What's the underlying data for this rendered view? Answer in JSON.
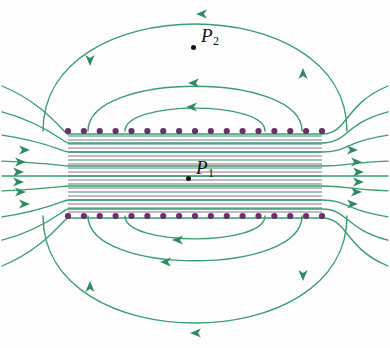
{
  "figure": {
    "kind": "electric-field-line-diagram",
    "background_color": "#fdfdfd",
    "line_color": "#3a9e6e",
    "line_color_dark": "#2f8a61",
    "charge_color": "#6b2f6b",
    "label_color": "#111111",
    "point_marker_color": "#111111"
  },
  "labels": {
    "p1": {
      "text": "P",
      "sub": "1",
      "x": 196,
      "y": 168,
      "dot_x": 186,
      "dot_y": 176
    },
    "p2": {
      "text": "P",
      "sub": "2",
      "x": 201,
      "y": 36,
      "dot_x": 191,
      "dot_y": 45
    }
  },
  "plates": {
    "top": {
      "y": 131,
      "x_start": 68,
      "x_end": 322,
      "count": 17,
      "dot_radius": 3.1,
      "charge_sign": "+"
    },
    "bottom": {
      "y": 216,
      "x_start": 68,
      "x_end": 322,
      "count": 17,
      "dot_radius": 3.1,
      "charge_sign": "-"
    }
  },
  "chart_data": {
    "type": "line",
    "title": "",
    "xlabel": "",
    "ylabel": "",
    "grid": false,
    "legend": "none",
    "xlim": [
      0,
      390
    ],
    "ylim": [
      0,
      348
    ],
    "interior_field_lines": {
      "description": "uniform dense horizontal field lines between the plates",
      "y_values": [
        136,
        140,
        144,
        148,
        152,
        156,
        160,
        164,
        168,
        172,
        176,
        180,
        184,
        188,
        192,
        196,
        200,
        204,
        208,
        212
      ],
      "x_start": 68,
      "x_end": 322,
      "direction": "left-to-right"
    },
    "fringe_lines": {
      "description": "lines that exit the plate edges and bow outward horizontally",
      "entries": [
        {
          "y": 134,
          "bow": 20
        },
        {
          "y": 143,
          "bow": 13
        },
        {
          "y": 152,
          "bow": 7
        },
        {
          "y": 166,
          "bow": 2
        },
        {
          "y": 176,
          "bow": 0
        },
        {
          "y": 186,
          "bow": -2
        },
        {
          "y": 200,
          "bow": -7
        },
        {
          "y": 209,
          "bow": -13
        },
        {
          "y": 218,
          "bow": -20
        }
      ]
    },
    "outer_loops_top": [
      {
        "apex_y": 14,
        "half_width": 152,
        "arrow_frac": 0.52
      },
      {
        "apex_y": 82,
        "half_width": 107,
        "arrow_frac": 0.52
      },
      {
        "apex_y": 106,
        "half_width": 70,
        "arrow_frac": 0.52
      }
    ],
    "outer_loops_bottom": [
      {
        "apex_y": 333,
        "half_width": 152,
        "arrow_frac": 0.52
      },
      {
        "apex_y": 265,
        "half_width": 107,
        "arrow_frac": 0.52
      },
      {
        "apex_y": 241,
        "half_width": 70,
        "arrow_frac": 0.52
      }
    ],
    "arrow_markers": [
      {
        "name": "top-outer-apex",
        "x": 196,
        "y": 14,
        "dir": "left"
      },
      {
        "name": "top-mid-apex",
        "x": 188,
        "y": 83,
        "dir": "left"
      },
      {
        "name": "top-inner-apex",
        "x": 186,
        "y": 107,
        "dir": "left"
      },
      {
        "name": "top-left-limb",
        "x": 90,
        "y": 66,
        "dir": "down"
      },
      {
        "name": "top-right-limb",
        "x": 303,
        "y": 68,
        "dir": "up"
      },
      {
        "name": "bottom-outer-apex",
        "x": 190,
        "y": 333,
        "dir": "left"
      },
      {
        "name": "bottom-mid-apex",
        "x": 160,
        "y": 262,
        "dir": "left"
      },
      {
        "name": "bottom-inner-apex",
        "x": 172,
        "y": 240,
        "dir": "left"
      },
      {
        "name": "bottom-left-limb",
        "x": 90,
        "y": 281,
        "dir": "up"
      },
      {
        "name": "bottom-right-limb",
        "x": 303,
        "y": 281,
        "dir": "down"
      },
      {
        "name": "left-inflow-1",
        "x": 30,
        "y": 150,
        "dir": "right"
      },
      {
        "name": "left-inflow-2",
        "x": 26,
        "y": 162,
        "dir": "right"
      },
      {
        "name": "left-inflow-3",
        "x": 24,
        "y": 172,
        "dir": "right"
      },
      {
        "name": "left-inflow-4",
        "x": 24,
        "y": 182,
        "dir": "right"
      },
      {
        "name": "left-inflow-5",
        "x": 26,
        "y": 192,
        "dir": "right"
      },
      {
        "name": "left-inflow-6",
        "x": 30,
        "y": 204,
        "dir": "right"
      },
      {
        "name": "right-outflow-1",
        "x": 358,
        "y": 150,
        "dir": "right"
      },
      {
        "name": "right-outflow-2",
        "x": 362,
        "y": 162,
        "dir": "right"
      },
      {
        "name": "right-outflow-3",
        "x": 364,
        "y": 172,
        "dir": "right"
      },
      {
        "name": "right-outflow-4",
        "x": 364,
        "y": 182,
        "dir": "right"
      },
      {
        "name": "right-outflow-5",
        "x": 362,
        "y": 192,
        "dir": "right"
      },
      {
        "name": "right-outflow-6",
        "x": 358,
        "y": 204,
        "dir": "right"
      }
    ]
  }
}
